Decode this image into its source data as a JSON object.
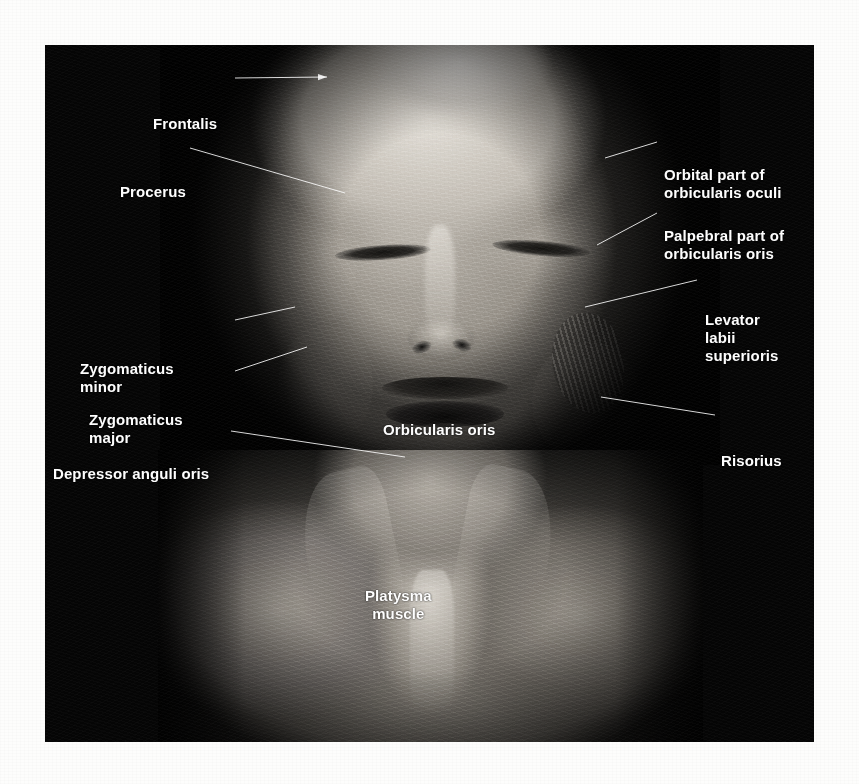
{
  "figure": {
    "kind": "anatomical-dissection-photograph",
    "background_color": "#050505",
    "label_color": "#ffffff",
    "paper_color": "#fdfdfc"
  },
  "labels": [
    {
      "id": "frontalis",
      "text": "Frontalis",
      "side": "left",
      "x": 108,
      "y": 70,
      "leader": {
        "x1": 190,
        "y1": 33,
        "x2": 282,
        "y2": 32,
        "arrow": true
      }
    },
    {
      "id": "procerus",
      "text": "Procerus",
      "side": "left",
      "x": 75,
      "y": 138,
      "leader": {
        "x1": 145,
        "y1": 103,
        "x2": 300,
        "y2": 148,
        "arrow": false
      }
    },
    {
      "id": "orbital-part-orbicularis-oculi",
      "text": "Orbital part of\norbicularis oculi",
      "side": "right",
      "x": 619,
      "y": 121,
      "leader": {
        "x1": 612,
        "y1": 97,
        "x2": 560,
        "y2": 113,
        "arrow": false
      }
    },
    {
      "id": "palpebral-part-orbicularis-oris",
      "text": "Palpebral part of\norbicularis oris",
      "side": "right",
      "x": 619,
      "y": 182,
      "leader": {
        "x1": 612,
        "y1": 168,
        "x2": 552,
        "y2": 200,
        "arrow": false
      }
    },
    {
      "id": "levator-labii-superioris",
      "text": "Levator\nlabii\nsuperioris",
      "side": "right",
      "x": 660,
      "y": 266,
      "leader": {
        "x1": 652,
        "y1": 235,
        "x2": 540,
        "y2": 262,
        "arrow": false
      }
    },
    {
      "id": "zygomaticus-minor",
      "text": "Zygomaticus\nminor",
      "side": "left",
      "x": 35,
      "y": 315,
      "leader": {
        "x1": 190,
        "y1": 275,
        "x2": 250,
        "y2": 262,
        "arrow": false
      }
    },
    {
      "id": "zygomaticus-major",
      "text": "Zygomaticus\nmajor",
      "side": "left",
      "x": 44,
      "y": 366,
      "leader": {
        "x1": 190,
        "y1": 326,
        "x2": 262,
        "y2": 302,
        "arrow": false
      }
    },
    {
      "id": "orbicularis-oris",
      "text": "Orbicularis oris",
      "side": "center",
      "x": 338,
      "y": 376,
      "leader": null
    },
    {
      "id": "depressor-anguli-oris",
      "text": "Depressor anguli oris",
      "side": "left",
      "x": 8,
      "y": 420,
      "leader": {
        "x1": 186,
        "y1": 386,
        "x2": 360,
        "y2": 412,
        "arrow": false
      }
    },
    {
      "id": "risorius",
      "text": "Risorius",
      "side": "right",
      "x": 676,
      "y": 407,
      "leader": {
        "x1": 670,
        "y1": 370,
        "x2": 556,
        "y2": 352,
        "arrow": false
      }
    },
    {
      "id": "platysma-muscle",
      "text": "Platysma\nmuscle",
      "side": "center",
      "x": 320,
      "y": 542,
      "leader": null
    }
  ]
}
